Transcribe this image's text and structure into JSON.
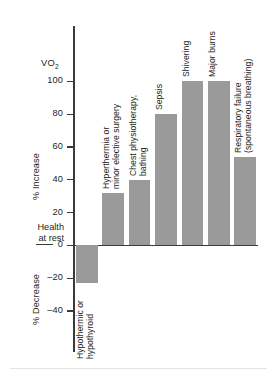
{
  "chart_data": {
    "type": "bar",
    "title": "",
    "measure_label": "VO₂",
    "ylabel_positive": "% Increase",
    "ylabel_negative": "% Decrease",
    "baseline_label": "Health\nat rest",
    "baseline_label_line1": "Health",
    "baseline_label_line2": "at rest",
    "xlabel": "",
    "ylabel": "",
    "ylim": [
      -48,
      112
    ],
    "grid": false,
    "legend": null,
    "bar_color": "#9a9a9a",
    "axis_color": "#3a3a3a",
    "yticks": [
      100,
      80,
      60,
      40,
      20,
      0,
      -20,
      -40
    ],
    "ytick_labels": [
      "100",
      "80",
      "60",
      "40",
      "20",
      "0",
      "–20",
      "–40"
    ],
    "categories": [
      "Hypothermic or hypothyroid",
      "Hyperthermia or minor elective surgery",
      "Chest physiotherapy, bathing",
      "Sepsis",
      "Shivering",
      "Major burns",
      "Respiratory failure (spontaneous breathing)"
    ],
    "values": [
      -23,
      32,
      40,
      80,
      100,
      100,
      54
    ]
  },
  "bars": [
    {
      "name": "hypothermic-or-hypothyroid",
      "value": -23,
      "label_line1": "Hypothermic or",
      "label_line2": "hypothyroid"
    },
    {
      "name": "hyperthermia-or-minor-elective-surgery",
      "value": 32,
      "label_line1": "Hyperthermia or",
      "label_line2": "minor elective surgery"
    },
    {
      "name": "chest-physiotherapy-bathing",
      "value": 40,
      "label_line1": "Chest physiotherapy,",
      "label_line2": "bathing"
    },
    {
      "name": "sepsis",
      "value": 80,
      "label_line1": "Sepsis",
      "label_line2": ""
    },
    {
      "name": "shivering",
      "value": 100,
      "label_line1": "Shivering",
      "label_line2": ""
    },
    {
      "name": "major-burns",
      "value": 100,
      "label_line1": "Major burns",
      "label_line2": ""
    },
    {
      "name": "respiratory-failure",
      "value": 54,
      "label_line1": "Respiratory failure",
      "label_line2": "(spontaneous breathing)"
    }
  ],
  "ticks": [
    {
      "value": 100,
      "label": "100"
    },
    {
      "value": 80,
      "label": "80"
    },
    {
      "value": 60,
      "label": "60"
    },
    {
      "value": 40,
      "label": "40"
    },
    {
      "value": 20,
      "label": "20"
    },
    {
      "value": 0,
      "label": "0"
    },
    {
      "value": -20,
      "label": "–20"
    },
    {
      "value": -40,
      "label": "–40"
    }
  ]
}
